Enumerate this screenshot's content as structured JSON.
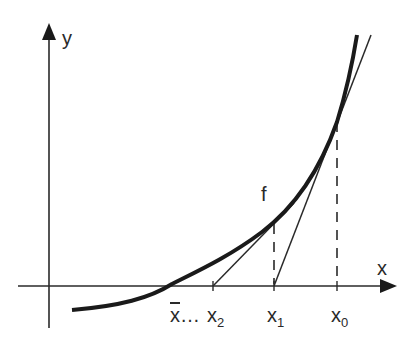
{
  "diagram": {
    "colors": {
      "ink": "#2a2a2a",
      "background": "#ffffff"
    },
    "axes": {
      "x_label": "x",
      "y_label": "y"
    },
    "function_label": "f",
    "points": {
      "xbar": {
        "base": "x",
        "ellipsis": "…"
      },
      "x2": {
        "base": "x",
        "sub": "2"
      },
      "x1": {
        "base": "x",
        "sub": "1"
      },
      "x0": {
        "base": "x",
        "sub": "0"
      }
    },
    "elements": [
      "y-axis with arrow",
      "x-axis with arrow",
      "convex curve f",
      "tangent at x0 meeting x-axis at x1",
      "tangent at x1 meeting x-axis at x2",
      "dashed vertical at x0",
      "dashed vertical at x1"
    ]
  }
}
